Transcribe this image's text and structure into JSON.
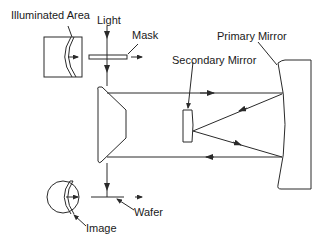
{
  "diagram": {
    "type": "optical-schematic",
    "labels": {
      "illuminated_area": "Illuminated Area",
      "light": "Light",
      "mask": "Mask",
      "primary_mirror": "Primary Mirror",
      "secondary_mirror": "Secondary Mirror",
      "wafer": "Wafer",
      "image": "Image"
    },
    "colors": {
      "stroke": "#2a2a2a",
      "background": "#ffffff",
      "text": "#1a1a1a"
    }
  }
}
